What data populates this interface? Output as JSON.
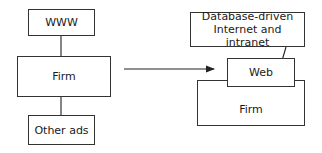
{
  "left": {
    "top_box": "WWW",
    "middle_box": "Firm",
    "bottom_box": "Other ads"
  },
  "right": {
    "callout_line1": "Database-driven",
    "callout_line2": "Internet and intranet",
    "web_box": "Web",
    "firm_box": "Firm"
  }
}
